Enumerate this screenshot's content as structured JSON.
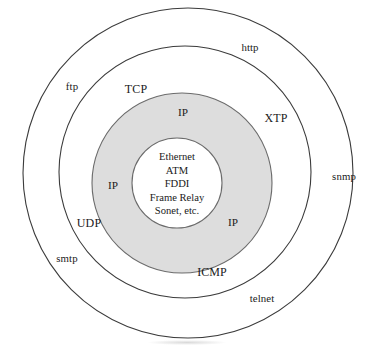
{
  "diagram": {
    "background_color": "#ffffff",
    "line_color": "#3b3b3b",
    "shaded_ring_color": "#dddddd",
    "rings": [
      {
        "name": "application-ring",
        "label": "application protocols",
        "cx": 188,
        "cy": 173,
        "r": 165,
        "fill": "none"
      },
      {
        "name": "transport-ring",
        "label": "transport protocols",
        "cx": 185,
        "cy": 172,
        "r": 126,
        "fill": "none"
      },
      {
        "name": "network-ring",
        "label": "network layer",
        "cx": 182,
        "cy": 183,
        "r": 90,
        "fill": "#dddddd"
      },
      {
        "name": "link-ring",
        "label": "link and physical layer",
        "cx": 177,
        "cy": 183,
        "r": 45,
        "fill": "#ffffff"
      }
    ],
    "labels": [
      {
        "name": "label-http",
        "text": "http",
        "layer": "app-layer",
        "x": 250,
        "y": 48
      },
      {
        "name": "label-ftp",
        "text": "ftp",
        "layer": "app-layer",
        "x": 72,
        "y": 87
      },
      {
        "name": "label-snmp",
        "text": "snmp",
        "layer": "app-layer",
        "x": 344,
        "y": 177
      },
      {
        "name": "label-smtp",
        "text": "smtp",
        "layer": "app-layer",
        "x": 67,
        "y": 259
      },
      {
        "name": "label-telnet",
        "text": "telnet",
        "layer": "app-layer",
        "x": 262,
        "y": 299
      },
      {
        "name": "label-tcp",
        "text": "TCP",
        "layer": "transport-layer",
        "x": 136,
        "y": 89
      },
      {
        "name": "label-xtp",
        "text": "XTP",
        "layer": "transport-layer",
        "x": 276,
        "y": 118
      },
      {
        "name": "label-udp",
        "text": "UDP",
        "layer": "transport-layer",
        "x": 89,
        "y": 223
      },
      {
        "name": "label-icmp",
        "text": "ICMP",
        "layer": "transport-layer",
        "x": 212,
        "y": 272
      },
      {
        "name": "label-ip-top",
        "text": "IP",
        "layer": "network-layer",
        "x": 183,
        "y": 113
      },
      {
        "name": "label-ip-left",
        "text": "IP",
        "layer": "network-layer",
        "x": 113,
        "y": 186
      },
      {
        "name": "label-ip-bottom-right",
        "text": "IP",
        "layer": "network-layer",
        "x": 233,
        "y": 223
      }
    ],
    "core": {
      "name": "core-technologies",
      "x": 177,
      "y": 184,
      "lines": [
        "Ethernet",
        "ATM",
        "FDDI",
        "Frame Relay",
        "Sonet, etc."
      ]
    }
  }
}
